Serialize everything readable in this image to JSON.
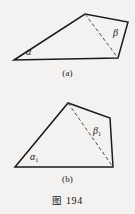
{
  "page": {
    "background_color": "#f3f2f0",
    "ink_color": "#1a1a1a",
    "width": 135,
    "height": 214
  },
  "figure_title": {
    "label": "图",
    "number": "194"
  },
  "figures": [
    {
      "id": "a",
      "caption": "(a)",
      "shape": "quadrilateral",
      "labels": [
        {
          "id": "alpha-a",
          "text": "α",
          "subscript": ""
        },
        {
          "id": "beta-a",
          "text": "β",
          "subscript": ""
        }
      ],
      "vertices": {
        "bottom_left": [
          14,
          60
        ],
        "apex": [
          85,
          14
        ],
        "top_right": [
          128,
          22
        ],
        "bottom_right": [
          118,
          58
        ]
      },
      "diagonal": {
        "from": "apex",
        "to": "bottom_right",
        "style": "dashed"
      }
    },
    {
      "id": "b",
      "caption": "(b)",
      "shape": "quadrilateral",
      "labels": [
        {
          "id": "alpha-b",
          "text": "α",
          "subscript": "1"
        },
        {
          "id": "beta-b",
          "text": "β",
          "subscript": "1"
        }
      ],
      "vertices": {
        "bottom_left": [
          15,
          167
        ],
        "apex": [
          68,
          103
        ],
        "top_right": [
          110,
          118
        ],
        "bottom_right": [
          113,
          167
        ]
      },
      "diagonal": {
        "from": "apex",
        "to": "bottom_right",
        "style": "dashed"
      }
    }
  ]
}
